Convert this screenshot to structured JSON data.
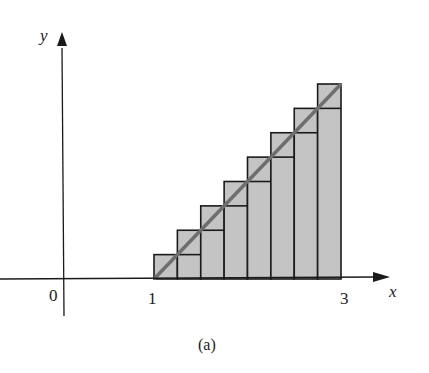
{
  "figure": {
    "caption": "(a)",
    "x_axis_label": "x",
    "y_axis_label": "y",
    "origin_label": "0",
    "tick_labels": [
      "1",
      "3"
    ],
    "colors": {
      "axis": "#1a1a1a",
      "bar_fill": "#c4c4c4",
      "bar_stroke": "#1a1a1a",
      "diagonal_line": "#6e6e6e"
    }
  },
  "chart_data": {
    "type": "bar",
    "title": "",
    "xlabel": "x",
    "ylabel": "y",
    "xlim": [
      1,
      3
    ],
    "n_subintervals": 8,
    "x_edges": [
      1.0,
      1.25,
      1.5,
      1.75,
      2.0,
      2.25,
      2.5,
      2.75,
      3.0
    ],
    "line": {
      "from": [
        1,
        0
      ],
      "to": [
        3,
        8
      ],
      "unit": "relative step height"
    },
    "lower_heights": [
      0,
      1,
      2,
      3,
      4,
      5,
      6,
      7
    ],
    "upper_heights": [
      1,
      2,
      3,
      4,
      5,
      6,
      7,
      8
    ]
  }
}
